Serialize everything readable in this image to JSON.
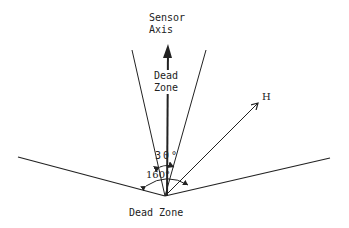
{
  "diagram": {
    "labels": {
      "sensor_axis_line1": "Sensor",
      "sensor_axis_line2": "Axis",
      "dead_zone_top_line1": "Dead",
      "dead_zone_top_line2": "Zone",
      "dead_zone_bottom": "Dead Zone",
      "vector_label": "H",
      "cone_angle": "30°",
      "wide_angle": "160°"
    },
    "colors": {
      "line": "#222222",
      "background": "#ffffff"
    }
  }
}
